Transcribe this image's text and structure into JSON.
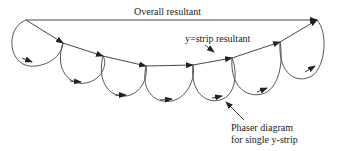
{
  "diagram": {
    "labels": {
      "overall_resultant": "Overall resultant",
      "strip_resultant": "y=strip resultant",
      "phaser_line1": "Phaser diagram",
      "phaser_line2": "for single y-strip"
    },
    "colors": {
      "stroke": "#333333",
      "background": "#ffffff"
    },
    "chord_points": [
      [
        26,
        20
      ],
      [
        63,
        43
      ],
      [
        103,
        56
      ],
      [
        146,
        66
      ],
      [
        193,
        65
      ],
      [
        232,
        58
      ],
      [
        280,
        42
      ],
      [
        317,
        20
      ]
    ],
    "strip_count": 7
  }
}
